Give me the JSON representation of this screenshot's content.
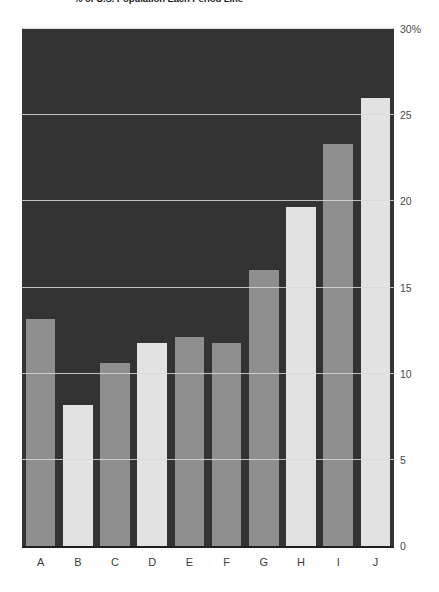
{
  "title": "% of U.S. Population Each Period Line",
  "chart_data": {
    "type": "bar",
    "title": "% of U.S. Population Each Period Line",
    "xlabel": "",
    "ylabel": "",
    "categories": [
      "A",
      "B",
      "C",
      "D",
      "E",
      "F",
      "G",
      "H",
      "I",
      "J"
    ],
    "values": [
      13.2,
      8.2,
      10.6,
      11.8,
      12.1,
      11.8,
      16.0,
      19.7,
      23.3,
      26.0
    ],
    "yticks": [
      0,
      5,
      10,
      15,
      20,
      25,
      30
    ],
    "ytick_labels": [
      "0",
      "5",
      "10",
      "15",
      "20",
      "25",
      "30%"
    ],
    "ylim": [
      0,
      30
    ],
    "grid": true,
    "legend": "none",
    "axis_position": "right",
    "colors": {
      "plot_background": "#333333",
      "gridline": "#d8d8d8",
      "bar_dark": "#8f8f8f",
      "bar_light": "#e2e2e2",
      "page_background": "#ffffff",
      "tick_label": "#4a4a4a"
    },
    "bar_colors": [
      "#8f8f8f",
      "#e2e2e2",
      "#8f8f8f",
      "#e2e2e2",
      "#8f8f8f",
      "#8f8f8f",
      "#8f8f8f",
      "#e2e2e2",
      "#8f8f8f",
      "#e2e2e2"
    ]
  }
}
